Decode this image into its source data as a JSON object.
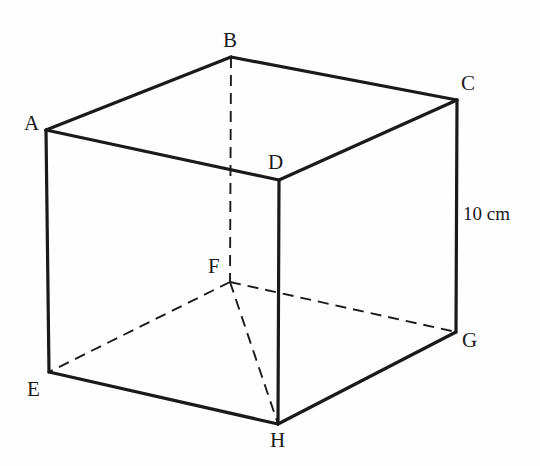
{
  "figure": {
    "shape": "cube",
    "stroke_color": "#1a1a1a",
    "background_color": "#fefefe",
    "solid_stroke_width": 3.2,
    "dashed_stroke_width": 1.9,
    "dash_pattern": "11 7",
    "vertices": [
      {
        "id": "A",
        "label": "A",
        "x": 46,
        "y": 130,
        "label_x": 24,
        "label_y": 113
      },
      {
        "id": "B",
        "label": "B",
        "x": 231,
        "y": 57,
        "label_x": 223,
        "label_y": 30
      },
      {
        "id": "C",
        "label": "C",
        "x": 457,
        "y": 100,
        "label_x": 461,
        "label_y": 73
      },
      {
        "id": "D",
        "label": "D",
        "x": 279,
        "y": 180,
        "label_x": 268,
        "label_y": 152
      },
      {
        "id": "E",
        "label": "E",
        "x": 49,
        "y": 372,
        "label_x": 27,
        "label_y": 379
      },
      {
        "id": "F",
        "label": "F",
        "x": 230,
        "y": 282,
        "label_x": 208,
        "label_y": 256
      },
      {
        "id": "G",
        "label": "G",
        "x": 456,
        "y": 332,
        "label_x": 462,
        "label_y": 330
      },
      {
        "id": "H",
        "label": "H",
        "x": 278,
        "y": 424,
        "label_x": 270,
        "label_y": 430
      }
    ],
    "edges_solid": [
      {
        "name": "edge-A-B",
        "from": "A",
        "to": "B"
      },
      {
        "name": "edge-B-C",
        "from": "B",
        "to": "C"
      },
      {
        "name": "edge-C-D",
        "from": "C",
        "to": "D"
      },
      {
        "name": "edge-D-A",
        "from": "D",
        "to": "A"
      },
      {
        "name": "edge-A-E",
        "from": "A",
        "to": "E"
      },
      {
        "name": "edge-C-G",
        "from": "C",
        "to": "G"
      },
      {
        "name": "edge-D-H",
        "from": "D",
        "to": "H"
      },
      {
        "name": "edge-E-H",
        "from": "E",
        "to": "H"
      },
      {
        "name": "edge-H-G",
        "from": "H",
        "to": "G"
      }
    ],
    "edges_dashed": [
      {
        "name": "edge-B-F",
        "from": "B",
        "to": "F"
      },
      {
        "name": "edge-F-E",
        "from": "F",
        "to": "E"
      },
      {
        "name": "edge-F-G",
        "from": "F",
        "to": "G"
      },
      {
        "name": "edge-F-H",
        "from": "F",
        "to": "H"
      }
    ],
    "dimensions": [
      {
        "name": "height-dimension",
        "text": "10 cm",
        "value": 10,
        "unit": "cm",
        "measures_edge": "edge-C-G",
        "x": 463,
        "y": 204
      }
    ]
  }
}
